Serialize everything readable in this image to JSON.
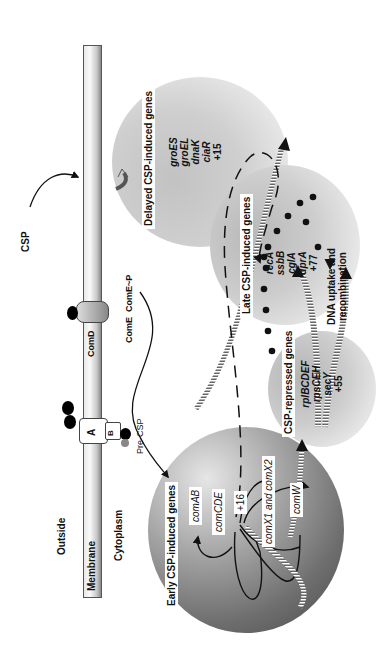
{
  "figure": {
    "labels": {
      "outside": "Outside",
      "membrane": "Membrane",
      "cytoplasm": "Cytoplasm",
      "csp": "CSP",
      "pre_csp": "Pre-CSP",
      "comd": "ComD",
      "come": "ComE",
      "come_p": "ComE~P",
      "transporter_a": "A",
      "transporter_b": "B",
      "dna_uptake": "DNA uptake and",
      "recombination": "recombination"
    },
    "gene_groups": {
      "early": {
        "title": "Early CSP-induced genes",
        "genes": [
          "comAB",
          "comCDE",
          "+16",
          "comX1 and comX2",
          "comW"
        ]
      },
      "delayed": {
        "title": "Delayed CSP-induced genes",
        "genes": [
          "groES",
          "groEL",
          "dnaK",
          "ciaR",
          "+15"
        ]
      },
      "late": {
        "title": "Late CSP-induced genes",
        "genes": [
          "recA",
          "ssbB",
          "cglA",
          "dprA",
          "+77"
        ]
      },
      "repressed": {
        "title": "CSP-repressed genes",
        "genes": [
          "rplBCDEF",
          "rpsCEH",
          "secY",
          "+55"
        ]
      }
    },
    "colors": {
      "early_dark": "#5a5a5a",
      "circle_light": "#bdbdbd",
      "ink": "#111111"
    }
  }
}
